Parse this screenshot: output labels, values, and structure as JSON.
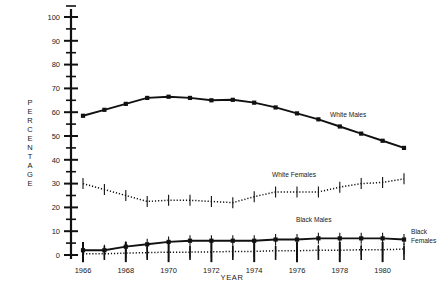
{
  "chart_data": {
    "type": "line",
    "title": "",
    "xlabel": "YEAR",
    "ylabel": "PERCENTAGE",
    "ylabel_letters": [
      "P",
      "E",
      "R",
      "C",
      "E",
      "N",
      "T",
      "A",
      "G",
      "E"
    ],
    "xlim": [
      1965.5,
      1981.5
    ],
    "ylim": [
      0,
      100
    ],
    "ytick_major": [
      0,
      10,
      20,
      30,
      40,
      50,
      60,
      70,
      80,
      90,
      100
    ],
    "ytick_minor": [
      5,
      15,
      25,
      35,
      45,
      55,
      65,
      75,
      85,
      95
    ],
    "ytick_labels": [
      "0",
      "10",
      "20",
      "30",
      "40",
      "50",
      "60",
      "70",
      "80",
      "90",
      "100"
    ],
    "xticks": [
      1966,
      1967,
      1968,
      1969,
      1970,
      1971,
      1972,
      1973,
      1974,
      1975,
      1976,
      1977,
      1978,
      1979,
      1980,
      1981
    ],
    "xtick_labels_shown": [
      "1966",
      "1968",
      "1970",
      "1972",
      "1974",
      "1976",
      "1978",
      "1980"
    ],
    "xtick_labeled_years": [
      1966,
      1968,
      1970,
      1972,
      1974,
      1976,
      1978,
      1980
    ],
    "grid": false,
    "legend_position": "inline-annotations",
    "x": [
      1966,
      1967,
      1968,
      1969,
      1970,
      1971,
      1972,
      1973,
      1974,
      1975,
      1976,
      1977,
      1978,
      1979,
      1980,
      1981
    ],
    "series": [
      {
        "name": "White Males",
        "style": "solid",
        "marker": "square",
        "color": "#111111",
        "label_x": 1977.2,
        "label_y": 56.0,
        "errorbars": false,
        "values": [
          58.5,
          61.0,
          63.5,
          66.0,
          66.5,
          66.0,
          65.0,
          65.2,
          64.0,
          62.0,
          59.5,
          57.0,
          54.0,
          51.0,
          48.0,
          45.0
        ]
      },
      {
        "name": "White Females",
        "style": "dotted",
        "marker": "none",
        "color": "#111111",
        "label_x": 1974.0,
        "label_y": 27.5,
        "errorbars": true,
        "values": [
          30.0,
          27.5,
          25.0,
          22.5,
          23.0,
          23.0,
          22.5,
          22.0,
          24.5,
          26.5,
          26.5,
          26.5,
          28.5,
          30.0,
          30.5,
          32.0
        ]
      },
      {
        "name": "Black Males",
        "style": "solid",
        "marker": "square",
        "color": "#111111",
        "label_x": 1976.0,
        "label_y": 10.5,
        "errorbars": true,
        "values": [
          2.0,
          2.0,
          3.5,
          4.5,
          5.5,
          6.0,
          6.0,
          6.0,
          6.0,
          6.5,
          6.5,
          7.0,
          7.0,
          7.0,
          7.0,
          6.5
        ]
      },
      {
        "name": "Black Females",
        "style": "dotted",
        "marker": "none",
        "color": "#111111",
        "label_x": 1981.5,
        "label_y": 5.5,
        "errorbars": true,
        "values": [
          0.5,
          0.5,
          0.8,
          1.0,
          1.2,
          1.2,
          1.3,
          1.5,
          1.5,
          1.8,
          1.8,
          2.0,
          2.0,
          2.2,
          2.2,
          2.5
        ]
      }
    ],
    "series_labels": [
      {
        "name": "White Males",
        "text": "White Males"
      },
      {
        "name": "White Females",
        "text": "White Females"
      },
      {
        "name": "Black Males",
        "text": "Black Males"
      },
      {
        "name": "Black Females",
        "text": "Black",
        "text2": "Females"
      }
    ]
  }
}
